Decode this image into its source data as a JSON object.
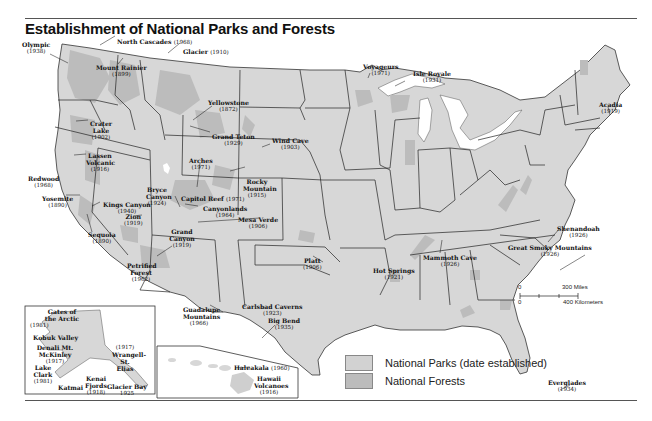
{
  "title": "Establishment of National Parks and Forests",
  "colors": {
    "land": "#d7d7d7",
    "forest": "#bdbdbd",
    "border": "#222222",
    "water": "#ffffff",
    "park_swatch": "#d2d2d2",
    "forest_swatch": "#bcbcbc"
  },
  "legend": {
    "items": [
      {
        "label": "National Parks (date established)",
        "swatch": "park"
      },
      {
        "label": "National Forests",
        "swatch": "forest"
      }
    ]
  },
  "scale_bar": {
    "zero_top": "0",
    "miles": "300 Miles",
    "zero_bottom": "0",
    "kilometers": "400 Kilometers"
  },
  "parks": [
    {
      "name": "Olympic",
      "year": "(1938)"
    },
    {
      "name": "North Cascades",
      "year": "(1968)"
    },
    {
      "name": "Glacier",
      "year": "(1910)"
    },
    {
      "name": "Mount Rainier",
      "year": "(1899)"
    },
    {
      "name": "Yellowstone",
      "year": "(1872)"
    },
    {
      "name": "Crater Lake",
      "year": "(1902)"
    },
    {
      "name": "Grand Teton",
      "year": "(1929)"
    },
    {
      "name": "Wind Cave",
      "year": "(1903)"
    },
    {
      "name": "Lassen Volcanic",
      "year": "(1916)"
    },
    {
      "name": "Arches",
      "year": "(1971)"
    },
    {
      "name": "Redwood",
      "year": "(1968)"
    },
    {
      "name": "Rocky Mountain",
      "year": "(1915)"
    },
    {
      "name": "Yosemite",
      "year": "(1890)"
    },
    {
      "name": "Bryce Canyon",
      "year": "(1924)"
    },
    {
      "name": "Capitol Reef",
      "year": "(1971)"
    },
    {
      "name": "Kings Canyon",
      "year": "(1940)"
    },
    {
      "name": "Canyonlands",
      "year": "(1964)"
    },
    {
      "name": "Zion",
      "year": "(1919)"
    },
    {
      "name": "Mesa Verde",
      "year": "(1906)"
    },
    {
      "name": "Sequoia",
      "year": "(1890)"
    },
    {
      "name": "Grand Canyon",
      "year": "(1919)"
    },
    {
      "name": "Petrified Forest",
      "year": "(1962)"
    },
    {
      "name": "Platt",
      "year": "(1906)"
    },
    {
      "name": "Hot Springs",
      "year": "(1921)"
    },
    {
      "name": "Carlsbad Caverns",
      "year": "(1923)"
    },
    {
      "name": "Guadalupe Mountains",
      "year": "(1966)"
    },
    {
      "name": "Big Bend",
      "year": "(1935)"
    },
    {
      "name": "Voyageurs",
      "year": "(1971)"
    },
    {
      "name": "Isle Royale",
      "year": "(1931)"
    },
    {
      "name": "Acadia",
      "year": "(1919)"
    },
    {
      "name": "Shenandoah",
      "year": "(1926)"
    },
    {
      "name": "Mammoth Cave",
      "year": "(1926)"
    },
    {
      "name": "Great Smoky Mountains",
      "year": "(1926)"
    },
    {
      "name": "Everglades",
      "year": "(1934)"
    },
    {
      "name": "Haleakala",
      "year": "(1960)"
    },
    {
      "name": "Hawaii Volcanoes",
      "year": "(1916)"
    },
    {
      "name": "Gates of the Arctic",
      "year": "(1981)"
    },
    {
      "name": "Kobuk Valley",
      "year": ""
    },
    {
      "name": "Denali Mt. McKinley",
      "year": "(1917)"
    },
    {
      "name": "Lake Clark",
      "year": "(1981)"
    },
    {
      "name": "Katmai",
      "year": ""
    },
    {
      "name": "Kenai Fjords",
      "year": "(1918)"
    },
    {
      "name": "Wrangell-St. Elias",
      "year": "(1917)"
    },
    {
      "name": "Glacier Bay",
      "year": "1925"
    }
  ]
}
